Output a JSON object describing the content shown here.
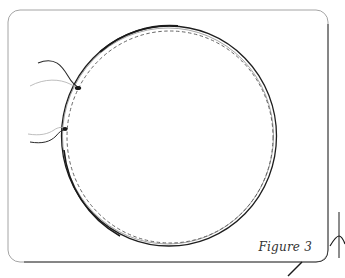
{
  "figure": {
    "caption": "Figure 3",
    "colors": {
      "background": "#ffffff",
      "frame": "#8a8a8a",
      "frame_shadow": "#3a3a3a",
      "ring_outer": "#1e1e1e",
      "ring_dashed": "#555555",
      "thread_dark": "#2a2a2a",
      "thread_light": "#b5b5b5",
      "caption": "#333333"
    },
    "frame": {
      "x": 8,
      "y": 10,
      "width": 320,
      "height": 252,
      "corner_radius": 12
    },
    "ring": {
      "cx": 169,
      "cy": 136,
      "r": 108,
      "dashed_r": 103
    },
    "knots": [
      {
        "x": 78,
        "y": 88
      },
      {
        "x": 65,
        "y": 129
      }
    ]
  }
}
